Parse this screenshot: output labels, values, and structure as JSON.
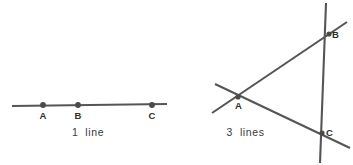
{
  "page": {
    "width": 353,
    "height": 165,
    "background_color": "#ffffff",
    "stroke_color": "#555555",
    "label_color": "#2e2e2e"
  },
  "figures": [
    {
      "id": "one-line",
      "caption": "1  line",
      "line_count": 1,
      "points": [
        {
          "label": "A",
          "x": 43,
          "y": 105
        },
        {
          "label": "B",
          "x": 78,
          "y": 105
        },
        {
          "label": "C",
          "x": 152,
          "y": 105
        }
      ],
      "lines": [
        {
          "name": "horizontal-line",
          "x1": 12,
          "y1": 106,
          "x2": 167,
          "y2": 104
        }
      ]
    },
    {
      "id": "three-lines",
      "caption": "3  lines",
      "line_count": 3,
      "points": [
        {
          "label": "A",
          "x": 62,
          "y": 97
        },
        {
          "label": "B",
          "x": 153,
          "y": 34
        },
        {
          "label": "C",
          "x": 146,
          "y": 133
        }
      ],
      "lines": [
        {
          "name": "line-through-a-and-b",
          "x1": 36,
          "y1": 113,
          "x2": 171,
          "y2": 22
        },
        {
          "name": "line-through-a-and-c",
          "x1": 39,
          "y1": 84,
          "x2": 174,
          "y2": 148
        },
        {
          "name": "line-through-b-and-c",
          "x1": 150,
          "y1": 3,
          "x2": 144,
          "y2": 163
        }
      ]
    }
  ]
}
